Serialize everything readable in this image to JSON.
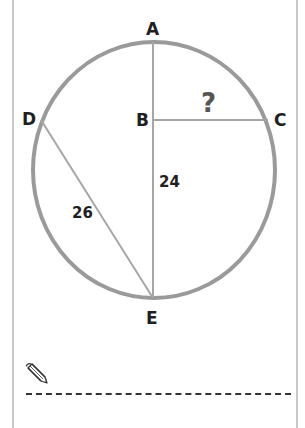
{
  "diagram": {
    "type": "circle-geometry",
    "points": {
      "A": {
        "label": "A"
      },
      "B": {
        "label": "B"
      },
      "C": {
        "label": "C"
      },
      "D": {
        "label": "D"
      },
      "E": {
        "label": "E"
      }
    },
    "segments": [
      {
        "from": "A",
        "to": "E",
        "label": "24",
        "label_ref": "BE"
      },
      {
        "from": "B",
        "to": "C",
        "label": "?"
      },
      {
        "from": "D",
        "to": "E",
        "label": "26"
      }
    ],
    "labels": {
      "be_length": "24",
      "de_length": "26",
      "unknown": "?"
    },
    "colors": {
      "circle": "#9a9a9a",
      "lines": "#a6a6a6",
      "text": "#1f1f1f",
      "question": "#555555",
      "frame": "#c9c9c9"
    }
  },
  "answer_area": {
    "icon": "pencil-icon",
    "line_style": "dashed"
  }
}
